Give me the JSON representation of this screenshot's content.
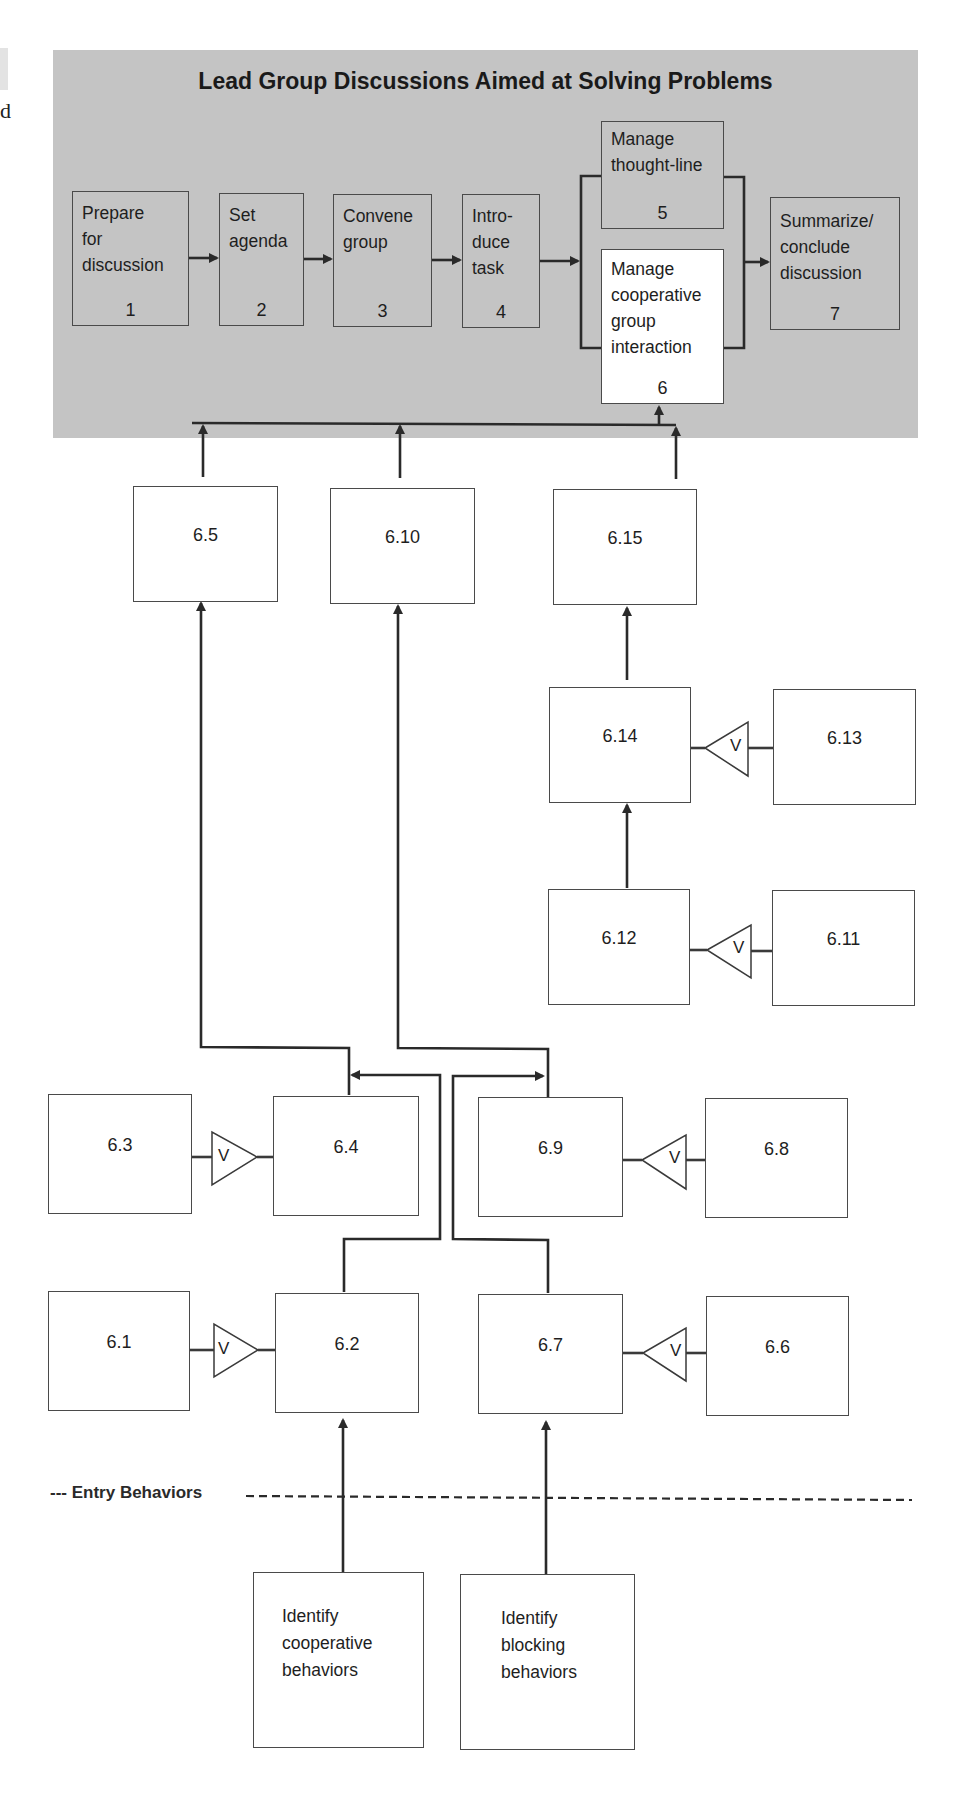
{
  "diagram": {
    "title": "Lead Group Discussions Aimed at Solving Problems",
    "colors": {
      "panel": "#c4c4c4",
      "line": "#2a2a2a",
      "box_border": "#4a4a4a",
      "highlight_box": "#ffffff"
    },
    "main_steps": [
      {
        "id": "1",
        "label": "Prepare\nfor\ndiscussion",
        "number": "1"
      },
      {
        "id": "2",
        "label": "Set\nagenda",
        "number": "2"
      },
      {
        "id": "3",
        "label": "Convene\ngroup",
        "number": "3"
      },
      {
        "id": "4",
        "label": "Intro-\nduce\ntask",
        "number": "4"
      },
      {
        "id": "5",
        "label": "Manage\nthought-line",
        "number": "5"
      },
      {
        "id": "6",
        "label": "Manage\ncooperative\ngroup\ninteraction",
        "number": "6",
        "highlighted": true
      },
      {
        "id": "7",
        "label": "Summarize/\nconclude\ndiscussion",
        "number": "7"
      }
    ],
    "subskills": {
      "s6_1": "6.1",
      "s6_2": "6.2",
      "s6_3": "6.3",
      "s6_4": "6.4",
      "s6_5": "6.5",
      "s6_6": "6.6",
      "s6_7": "6.7",
      "s6_8": "6.8",
      "s6_9": "6.9",
      "s6_10": "6.10",
      "s6_11": "6.11",
      "s6_12": "6.12",
      "s6_13": "6.13",
      "s6_14": "6.14",
      "s6_15": "6.15"
    },
    "verbal_info_symbol": "V",
    "entry_line_label": "--- Entry Behaviors",
    "entry_behaviors": [
      {
        "label": "Identify\ncooperative\nbehaviors"
      },
      {
        "label": "Identify\nblocking\nbehaviors"
      }
    ],
    "edge_fragments": {
      "left_letter": "d"
    }
  }
}
